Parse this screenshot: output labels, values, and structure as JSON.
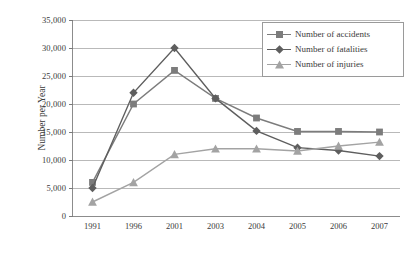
{
  "chart_data": {
    "type": "line",
    "title": "",
    "xlabel": "",
    "ylabel": "Number per Year",
    "categories": [
      "1991",
      "1996",
      "2001",
      "2003",
      "2004",
      "2005",
      "2006",
      "2007"
    ],
    "ylim": [
      0,
      35000
    ],
    "ytick_values": [
      0,
      5000,
      10000,
      15000,
      20000,
      25000,
      30000,
      35000
    ],
    "ytick_labels": [
      "0",
      "5,000",
      "10,000",
      "15,000",
      "20,000",
      "25,000",
      "30,000",
      "35,000"
    ],
    "grid": true,
    "legend_position": "top-right",
    "series": [
      {
        "name": "Number of accidents",
        "marker": "square",
        "color": "#7c7c7c",
        "values": [
          6000,
          20000,
          26000,
          21000,
          17500,
          15100,
          15100,
          15000
        ]
      },
      {
        "name": "Number of fatalities",
        "marker": "diamond",
        "color": "#5e5e5e",
        "values": [
          5000,
          22000,
          30000,
          21000,
          15200,
          12200,
          11700,
          10700
        ]
      },
      {
        "name": "Number of injuries",
        "marker": "triangle",
        "color": "#a3a3a3",
        "values": [
          2500,
          6000,
          11000,
          12000,
          12000,
          11600,
          12500,
          13200
        ]
      }
    ]
  },
  "legend": {
    "items": [
      {
        "label": "Number of accidents"
      },
      {
        "label": "Number of fatalities"
      },
      {
        "label": "Number of injuries"
      }
    ]
  },
  "colors": {
    "accidents": "#7c7c7c",
    "fatalities": "#5e5e5e",
    "injuries": "#a3a3a3",
    "grid": "#b9b9b9",
    "axis": "#8c8c8c",
    "text": "#3a3a3a"
  }
}
